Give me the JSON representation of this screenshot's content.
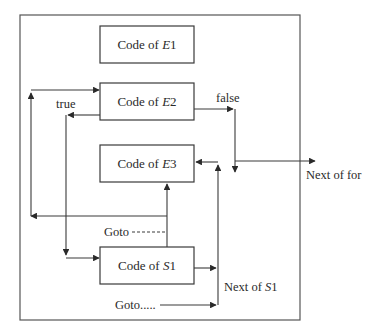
{
  "diagram": {
    "boxes": [
      {
        "id": "e1",
        "prefix": "Code of ",
        "var": "E",
        "num": "1"
      },
      {
        "id": "e2",
        "prefix": "Code of ",
        "var": "E",
        "num": "2"
      },
      {
        "id": "e3",
        "prefix": "Code of ",
        "var": "E",
        "num": "3"
      },
      {
        "id": "s1",
        "prefix": "Code of ",
        "var": "S",
        "num": "1"
      }
    ],
    "labels": {
      "true": "true",
      "false": "false",
      "next_of_for": "Next of for",
      "next_of_s1_prefix": "Next of ",
      "next_of_s1_var": "S",
      "next_of_s1_num": "1",
      "goto_dashed": "Goto",
      "goto_dots": "Goto....."
    },
    "colors": {
      "line": "#3a3a3a",
      "frame": "#555555",
      "background": "#ffffff"
    }
  }
}
